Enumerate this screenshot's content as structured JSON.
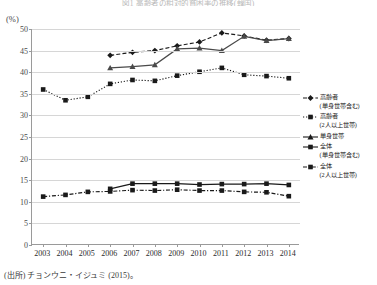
{
  "figure": {
    "title": "図1 高齢者の相対的貧困率の推移(韓国)",
    "y_unit": "(%)",
    "source": "(出所) チョンウニ・イジュミ (2015)。"
  },
  "legend": {
    "position": "right",
    "items": [
      {
        "key": "series-elderly-incl-single",
        "label": "高齢者",
        "sub": "(単身世帯含む)",
        "style": "dashed",
        "marker": "diamond"
      },
      {
        "key": "series-elderly-two-plus",
        "label": "高齢者",
        "sub": "(2人以上世帯)",
        "style": "dotted",
        "marker": "square"
      },
      {
        "key": "series-single-household",
        "label": "単身世帯",
        "sub": "",
        "style": "solid",
        "marker": "triangle"
      },
      {
        "key": "series-total-incl-single",
        "label": "全体",
        "sub": "(単身世帯含む)",
        "style": "solid",
        "marker": "square"
      },
      {
        "key": "series-total-two-plus",
        "label": "全体",
        "sub": "(2人以上世帯)",
        "style": "dashdot",
        "marker": "square"
      }
    ]
  },
  "chart_data": {
    "type": "line",
    "title": "図1 高齢者の相対的貧困率の推移(韓国)",
    "xlabel": "",
    "ylabel": "(%)",
    "ylim": [
      0,
      50
    ],
    "ytick_step": 5,
    "yticks": [
      0,
      5,
      10,
      15,
      20,
      25,
      30,
      35,
      40,
      45,
      50
    ],
    "grid": true,
    "legend_position": "right",
    "categories": [
      "2003",
      "2004",
      "2005",
      "2006",
      "2007",
      "2008",
      "2009",
      "2010",
      "2011",
      "2012",
      "2013",
      "2014"
    ],
    "series": [
      {
        "name": "高齢者(単身世帯含む)",
        "color": "#1a1a1a",
        "style": "dashed",
        "marker": "diamond",
        "values": [
          null,
          null,
          null,
          43.9,
          44.6,
          45.0,
          46.1,
          47.0,
          49.1,
          48.4,
          47.4,
          47.8
        ]
      },
      {
        "name": "高齢者(2人以上世帯)",
        "color": "#1a1a1a",
        "style": "dotted",
        "marker": "square",
        "values": [
          36.0,
          33.5,
          34.3,
          37.3,
          38.2,
          38.0,
          39.2,
          40.1,
          41.0,
          39.4,
          39.1,
          38.6
        ]
      },
      {
        "name": "単身世帯",
        "color": "#4a4a4a",
        "style": "solid",
        "marker": "triangle",
        "values": [
          null,
          null,
          null,
          41.0,
          41.3,
          41.7,
          45.4,
          45.6,
          45.0,
          48.3,
          47.3,
          47.8
        ]
      },
      {
        "name": "全体(単身世帯含む)",
        "color": "#1a1a1a",
        "style": "solid",
        "marker": "square",
        "values": [
          null,
          null,
          null,
          13.0,
          14.2,
          14.2,
          14.2,
          14.0,
          14.1,
          14.1,
          14.2,
          13.9
        ]
      },
      {
        "name": "全体(2人以上世帯)",
        "color": "#1a1a1a",
        "style": "dashdot",
        "marker": "square",
        "values": [
          11.2,
          11.6,
          12.3,
          12.4,
          12.7,
          12.6,
          12.8,
          12.6,
          12.6,
          12.3,
          12.2,
          11.3
        ]
      }
    ]
  }
}
